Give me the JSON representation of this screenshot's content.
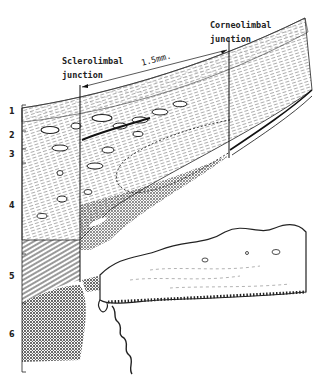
{
  "figure": {
    "type": "anatomical cross-section diagram",
    "annotations": {
      "sclerolimbal": {
        "line1": "Sclerolimbal",
        "line2": "junction"
      },
      "corneolimbal": {
        "line1": "Corneolimbal",
        "line2": "junction"
      },
      "measurement": "1.5mm."
    },
    "layer_labels": [
      "1",
      "2",
      "3",
      "4",
      "5",
      "6"
    ]
  }
}
